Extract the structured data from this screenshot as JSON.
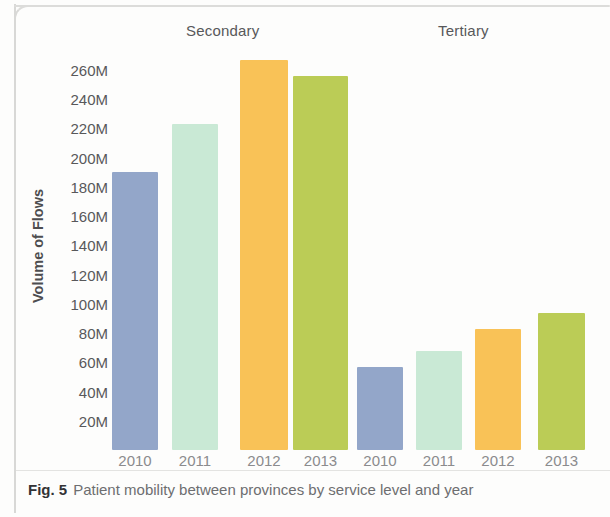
{
  "caption": {
    "label": "Fig. 5",
    "text": "Patient mobility between provinces by service level and year"
  },
  "chart_data": {
    "type": "bar",
    "title": "",
    "xlabel": "",
    "ylabel": "Volume of Flows",
    "ylim": [
      0,
      270000000
    ],
    "grid": false,
    "legend": "none",
    "tick_suffix": "M",
    "y_ticks": [
      {
        "label": "260M",
        "value": 260
      },
      {
        "label": "240M",
        "value": 240
      },
      {
        "label": "220M",
        "value": 220
      },
      {
        "label": "200M",
        "value": 200
      },
      {
        "label": "180M",
        "value": 180
      },
      {
        "label": "160M",
        "value": 160
      },
      {
        "label": "140M",
        "value": 140
      },
      {
        "label": "120M",
        "value": 120
      },
      {
        "label": "100M",
        "value": 100
      },
      {
        "label": "80M",
        "value": 80
      },
      {
        "label": "60M",
        "value": 60
      },
      {
        "label": "40M",
        "value": 40
      },
      {
        "label": "20M",
        "value": 20
      }
    ],
    "groups": [
      {
        "name": "Secondary",
        "label": "Secondary"
      },
      {
        "name": "Tertiary",
        "label": "Tertiary"
      }
    ],
    "categories": [
      "2010",
      "2011",
      "2012",
      "2013"
    ],
    "series": [
      {
        "name": "Secondary",
        "values": [
          190,
          223,
          267,
          256
        ]
      },
      {
        "name": "Tertiary",
        "values": [
          57,
          68,
          83,
          94
        ]
      }
    ],
    "bars": [
      {
        "group": "Secondary",
        "category": "2010",
        "value": 190,
        "color": "#93a6c9"
      },
      {
        "group": "Secondary",
        "category": "2011",
        "value": 223,
        "color": "#c9e9d5"
      },
      {
        "group": "Secondary",
        "category": "2012",
        "value": 267,
        "color": "#f9c257"
      },
      {
        "group": "Secondary",
        "category": "2013",
        "value": 256,
        "color": "#bbcc56"
      },
      {
        "group": "Tertiary",
        "category": "2010",
        "value": 57,
        "color": "#93a6c9"
      },
      {
        "group": "Tertiary",
        "category": "2011",
        "value": 68,
        "color": "#c9e9d5"
      },
      {
        "group": "Tertiary",
        "category": "2012",
        "value": 83,
        "color": "#f9c257"
      },
      {
        "group": "Tertiary",
        "category": "2013",
        "value": 94,
        "color": "#bbcc56"
      }
    ],
    "colors": {
      "2010": "#93a6c9",
      "2011": "#c9e9d5",
      "2012": "#f9c257",
      "2013": "#bbcc56",
      "axis_text": "#58585a",
      "tick_text": "#8b8b8d"
    }
  }
}
